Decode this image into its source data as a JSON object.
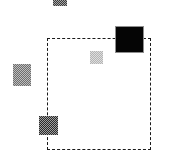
{
  "figure": {
    "title": "",
    "background_color": "#ffffff",
    "width": 169,
    "height": 159
  },
  "selection": {
    "name": "dashed-selection-rectangle",
    "x": 47,
    "y": 38,
    "width": 104,
    "height": 112,
    "border_color": "#1a1a1a",
    "border_style": "dashed",
    "border_width": 1,
    "label": ""
  },
  "shapes": [
    {
      "id": "square-top-clipped",
      "label": "",
      "x": 53,
      "y": -2,
      "width": 14,
      "height": 8,
      "fill": "#3b3b3b",
      "texture": "dither",
      "outline": false,
      "inside_selection": false
    },
    {
      "id": "square-large-black",
      "label": "",
      "x": 115,
      "y": 26,
      "width": 29,
      "height": 27,
      "fill": "#050505",
      "texture": "solid",
      "outline": true,
      "inside_selection": false
    },
    {
      "id": "square-left-gray",
      "label": "",
      "x": 13,
      "y": 64,
      "width": 18,
      "height": 22,
      "fill": "#6d6d6d",
      "texture": "dither",
      "outline": false,
      "inside_selection": false
    },
    {
      "id": "square-center-light",
      "label": "",
      "x": 90,
      "y": 51,
      "width": 13,
      "height": 13,
      "fill": "#b4b4b4",
      "texture": "dither",
      "outline": false,
      "inside_selection": true
    },
    {
      "id": "square-bottom-dark",
      "label": "",
      "x": 39,
      "y": 116,
      "width": 19,
      "height": 19,
      "fill": "#2b2b2b",
      "texture": "dither",
      "outline": false,
      "inside_selection": false
    }
  ]
}
